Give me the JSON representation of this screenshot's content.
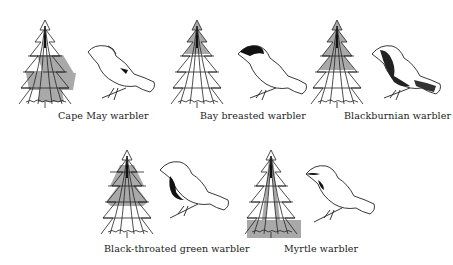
{
  "figure": {
    "shade_color": "#a9a9a9",
    "line_color": "#222222",
    "panels": [
      {
        "label": "Cape May warbler",
        "zone": "middle band, outer to inner",
        "shade_from": 0.42,
        "shade_to": 0.85
      },
      {
        "label": "Bay breasted warbler",
        "zone": "top inner",
        "shade_from": 0.0,
        "shade_to": 0.45
      },
      {
        "label": "Blackburnian warbler",
        "zone": "top to middle",
        "shade_from": 0.0,
        "shade_to": 0.62
      },
      {
        "label": "Black-throated green warbler",
        "zone": "upper-middle band, inner",
        "shade_from": 0.2,
        "shade_to": 0.62
      },
      {
        "label": "Myrtle warbler",
        "zone": "bottom / ground",
        "shade_from": 0.82,
        "shade_to": 1.0
      }
    ]
  }
}
